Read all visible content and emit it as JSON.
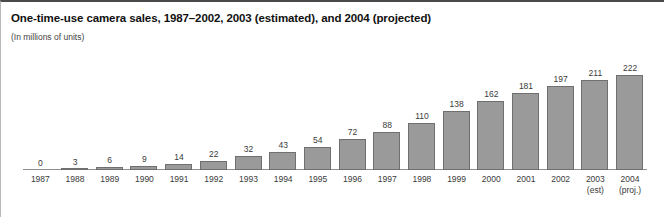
{
  "chart_data": {
    "type": "bar",
    "title": "One-time-use camera sales, 1987–2002, 2003 (estimated), and 2004 (projected)",
    "subtitle": "(In millions of units)",
    "xlabel": "",
    "ylabel": "",
    "ylim": [
      0,
      222
    ],
    "grid": false,
    "legend": "none",
    "bar_color": "#9a9a9a",
    "bar_border_color": "#6f6f6f",
    "axis_color": "#8e8e8e",
    "categories": [
      "1987",
      "1988",
      "1989",
      "1990",
      "1991",
      "1992",
      "1993",
      "1994",
      "1995",
      "1996",
      "1997",
      "1998",
      "1999",
      "2000",
      "2001",
      "2002",
      "2003",
      "2004"
    ],
    "category_sublabels": [
      "",
      "",
      "",
      "",
      "",
      "",
      "",
      "",
      "",
      "",
      "",
      "",
      "",
      "",
      "",
      "",
      "(est)",
      "(proj.)"
    ],
    "values": [
      0,
      3,
      6,
      9,
      14,
      22,
      32,
      43,
      54,
      72,
      88,
      110,
      138,
      162,
      181,
      197,
      211,
      222
    ],
    "value_labels": [
      "0",
      "3",
      "6",
      "9",
      "14",
      "22",
      "32",
      "43",
      "54",
      "72",
      "88",
      "110",
      "138",
      "162",
      "181",
      "197",
      "211",
      "222"
    ]
  }
}
